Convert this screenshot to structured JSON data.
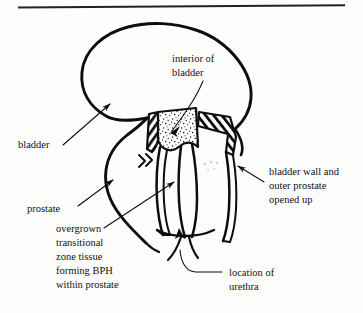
{
  "figure": {
    "top_rule": "horizontal-rule",
    "ink_color": "#0d0d0d",
    "background_color": "#fdfdfc"
  },
  "labels": {
    "bladder": {
      "text": "bladder",
      "lines": [
        "bladder"
      ]
    },
    "interior_of_bladder": {
      "text": "interior of bladder",
      "lines": [
        "interior of",
        "bladder"
      ]
    },
    "bladder_wall_opened": {
      "text": "bladder wall and outer prostate opened up",
      "lines": [
        "bladder wall and",
        "outer prostate",
        "opened up"
      ]
    },
    "prostate": {
      "text": "prostate",
      "lines": [
        "prostate"
      ]
    },
    "overgrown_tissue": {
      "text": "overgrown transitional zone tissue forming BPH within prostate",
      "lines": [
        "overgrown",
        "transitional",
        "zone tissue",
        "forming BPH",
        "within prostate"
      ]
    },
    "location_of_urethra": {
      "text": "location of urethra",
      "lines": [
        "location of",
        "urethra"
      ]
    }
  },
  "regions": {
    "bladder_interior_fill": "stippled",
    "cut_edge_left": "hatched",
    "cut_edge_right": "hatched",
    "direction_marks": "double-chevron"
  }
}
